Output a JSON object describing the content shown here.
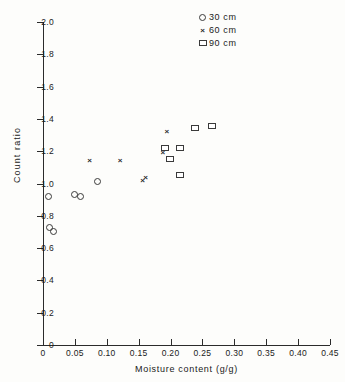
{
  "chart_data": {
    "type": "scatter",
    "title": "",
    "xlabel": "Moisture content (g/g)",
    "ylabel": "Count ratio",
    "xlim": [
      0,
      0.45
    ],
    "ylim": [
      0,
      2.0
    ],
    "xticks": [
      "0",
      "0.05",
      "0.10",
      "0.15",
      "0.20",
      "0.25",
      "0.30",
      "0.35",
      "0.40",
      "0.45"
    ],
    "xtick_values": [
      0,
      0.05,
      0.1,
      0.15,
      0.2,
      0.25,
      0.3,
      0.35,
      0.4,
      0.45
    ],
    "yticks": [
      "0",
      "0.2",
      "0.4",
      "0.6",
      "0.8",
      "1.0",
      "1.2",
      "1.4",
      "1.6",
      "1.8",
      "2.0"
    ],
    "ytick_values": [
      0,
      0.2,
      0.4,
      0.6,
      0.8,
      1.0,
      1.2,
      1.4,
      1.6,
      1.8,
      2.0
    ],
    "grid": false,
    "legend_position": "top-right",
    "series": [
      {
        "name": "30 cm",
        "marker": "circle",
        "points": [
          {
            "x": 0.01,
            "y": 0.73
          },
          {
            "x": 0.016,
            "y": 0.7
          },
          {
            "x": 0.009,
            "y": 0.92
          },
          {
            "x": 0.05,
            "y": 0.93
          },
          {
            "x": 0.059,
            "y": 0.92
          },
          {
            "x": 0.085,
            "y": 1.01
          }
        ]
      },
      {
        "name": "60 cm",
        "marker": "cross",
        "points": [
          {
            "x": 0.073,
            "y": 1.14
          },
          {
            "x": 0.121,
            "y": 1.14
          },
          {
            "x": 0.156,
            "y": 1.02
          },
          {
            "x": 0.161,
            "y": 1.04
          },
          {
            "x": 0.194,
            "y": 1.32
          },
          {
            "x": 0.188,
            "y": 1.19
          }
        ]
      },
      {
        "name": "90 cm",
        "marker": "square",
        "points": [
          {
            "x": 0.192,
            "y": 1.22
          },
          {
            "x": 0.216,
            "y": 1.22
          },
          {
            "x": 0.199,
            "y": 1.15
          },
          {
            "x": 0.216,
            "y": 1.05
          },
          {
            "x": 0.239,
            "y": 1.34
          },
          {
            "x": 0.265,
            "y": 1.355
          }
        ]
      }
    ]
  },
  "legend": {
    "items": [
      {
        "label": "30 cm",
        "symbol": "circle"
      },
      {
        "label": "60 cm",
        "symbol": "cross"
      },
      {
        "label": "90 cm",
        "symbol": "square"
      }
    ]
  },
  "symbols": {
    "cross_glyph": "×"
  }
}
